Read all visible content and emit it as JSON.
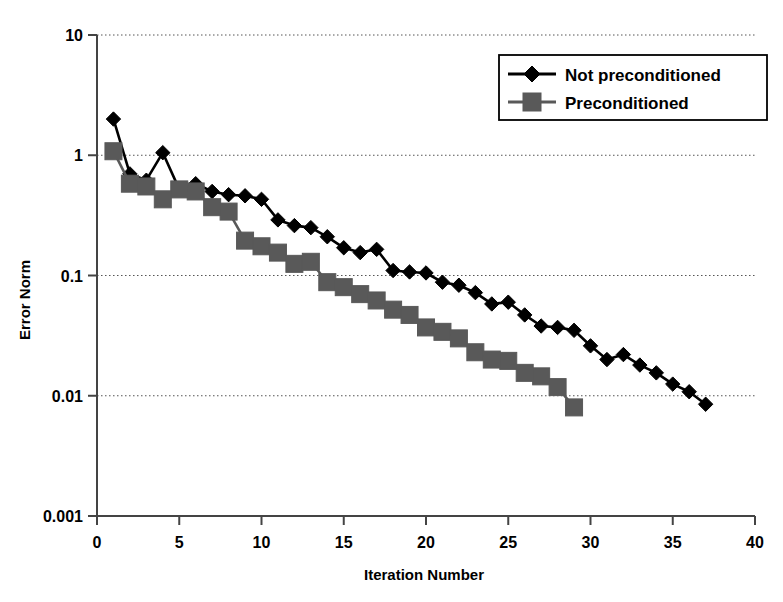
{
  "chart_data": {
    "type": "line",
    "title": "",
    "subtitle": "",
    "xlabel": "Iteration Number",
    "ylabel": "Error Norm",
    "xlim": [
      0,
      40
    ],
    "ylim": [
      0.001,
      10
    ],
    "yscale": "log",
    "xscale": "linear",
    "grid": true,
    "grid_axis": "y",
    "grid_style": "dotted",
    "legend_position": "top-right",
    "xticks": [
      0,
      5,
      10,
      15,
      20,
      25,
      30,
      35,
      40
    ],
    "xticklabels": [
      "0",
      "5",
      "10",
      "15",
      "20",
      "25",
      "30",
      "35",
      "40"
    ],
    "yticks": [
      0.001,
      0.01,
      0.1,
      1,
      10
    ],
    "yticklabels": [
      "0.001",
      "0.01",
      "0.1",
      "1",
      "10"
    ],
    "series": [
      {
        "name": "Not preconditioned",
        "color": "#000000",
        "marker": "diamond",
        "x": [
          1,
          2,
          3,
          4,
          5,
          6,
          7,
          8,
          9,
          10,
          11,
          12,
          13,
          14,
          15,
          16,
          17,
          18,
          19,
          20,
          21,
          22,
          23,
          24,
          25,
          26,
          27,
          28,
          29,
          30,
          31,
          32,
          33,
          34,
          35,
          36,
          37
        ],
        "values": [
          2.0,
          0.7,
          0.62,
          1.05,
          0.52,
          0.58,
          0.5,
          0.47,
          0.46,
          0.43,
          0.29,
          0.26,
          0.25,
          0.21,
          0.17,
          0.155,
          0.165,
          0.11,
          0.107,
          0.105,
          0.088,
          0.083,
          0.072,
          0.058,
          0.06,
          0.047,
          0.038,
          0.037,
          0.035,
          0.026,
          0.02,
          0.022,
          0.018,
          0.0155,
          0.0125,
          0.0108,
          0.0085
        ]
      },
      {
        "name": "Preconditioned",
        "color": "#595959",
        "marker": "square",
        "x": [
          1,
          2,
          3,
          4,
          5,
          6,
          7,
          8,
          9,
          10,
          11,
          12,
          13,
          14,
          15,
          16,
          17,
          18,
          19,
          20,
          21,
          22,
          23,
          24,
          25,
          26,
          27,
          28,
          29
        ],
        "values": [
          1.08,
          0.58,
          0.55,
          0.43,
          0.52,
          0.5,
          0.37,
          0.34,
          0.195,
          0.175,
          0.155,
          0.125,
          0.13,
          0.088,
          0.08,
          0.07,
          0.062,
          0.052,
          0.047,
          0.037,
          0.034,
          0.03,
          0.023,
          0.02,
          0.0195,
          0.0155,
          0.0145,
          0.0118,
          0.008
        ]
      }
    ]
  },
  "axes": {
    "x_title": "Iteration Number",
    "y_title": "Error Norm"
  },
  "legend": {
    "entries": [
      {
        "label": "Not preconditioned",
        "marker": "diamond-marker",
        "color": "#000000"
      },
      {
        "label": "Preconditioned",
        "marker": "square-marker",
        "color": "#595959"
      }
    ]
  }
}
